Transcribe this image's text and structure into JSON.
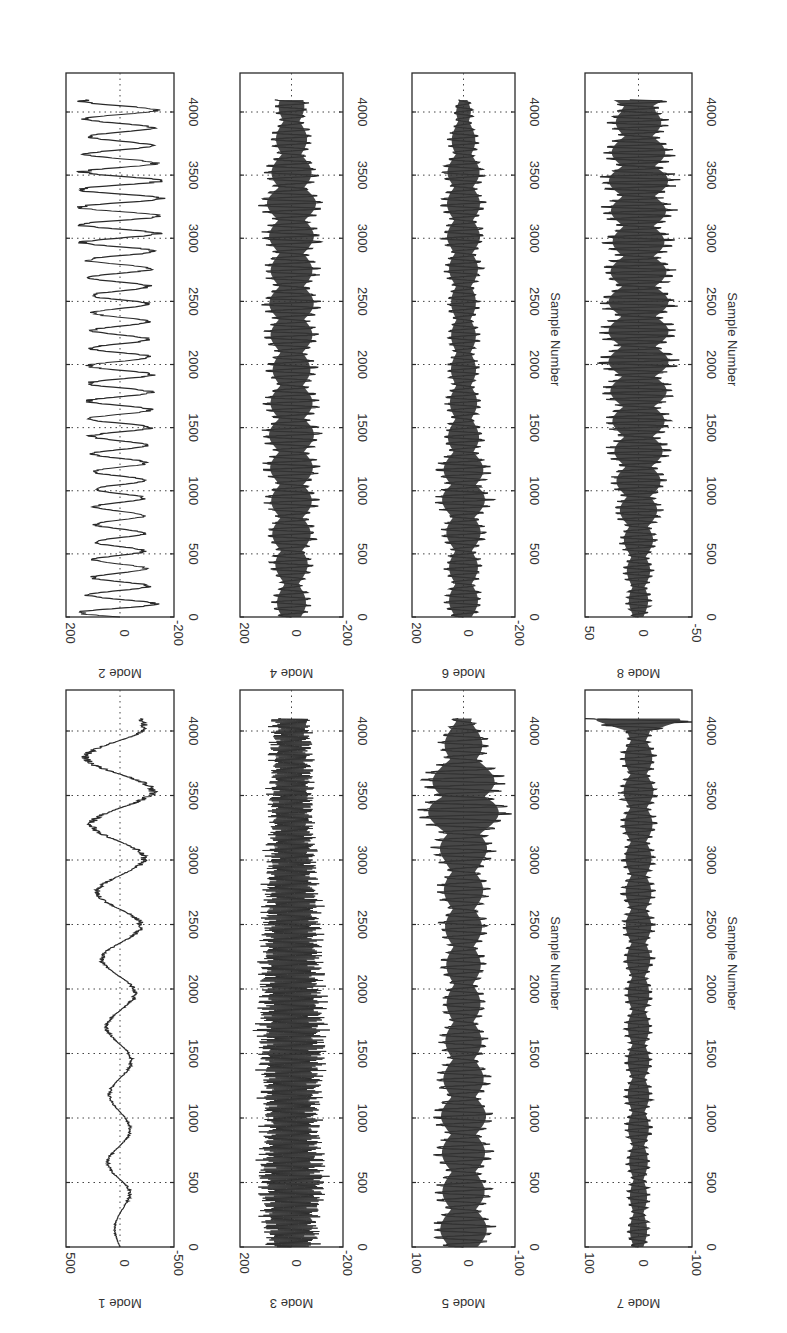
{
  "figure": {
    "orientation": "rotated-90-clockwise",
    "background": "#ffffff",
    "ink": "#2a2a2a"
  },
  "chart_data": {
    "type": "line",
    "title": "",
    "xlabel": "Sample Number",
    "x_ticks": [
      0,
      500,
      1000,
      1500,
      2000,
      2500,
      3000,
      3500,
      4000
    ],
    "xlim": [
      0,
      4300
    ],
    "grid": "dotted at x ticks and y=0",
    "legend": "none",
    "subplots": [
      {
        "name": "Mode 1",
        "ylabel": "Mode 1",
        "ylim": [
          -500,
          500
        ],
        "y_ticks": [
          -500,
          0,
          500
        ],
        "row": "lower",
        "col": 0,
        "style": "line",
        "envelope": [
          [
            0,
            40
          ],
          [
            300,
            60
          ],
          [
            500,
            120
          ],
          [
            1000,
            90
          ],
          [
            1500,
            110
          ],
          [
            2000,
            140
          ],
          [
            2500,
            200
          ],
          [
            3000,
            220
          ],
          [
            3500,
            300
          ],
          [
            3900,
            320
          ],
          [
            4096,
            200
          ]
        ],
        "freq": 0.012
      },
      {
        "name": "Mode 2",
        "ylabel": "Mode 2",
        "ylim": [
          -200,
          200
        ],
        "y_ticks": [
          -200,
          0,
          200
        ],
        "row": "upper",
        "col": 0,
        "style": "line",
        "envelope": [
          [
            0,
            150
          ],
          [
            200,
            110
          ],
          [
            500,
            90
          ],
          [
            1000,
            90
          ],
          [
            1500,
            110
          ],
          [
            1900,
            120
          ],
          [
            2300,
            100
          ],
          [
            2700,
            110
          ],
          [
            3000,
            140
          ],
          [
            3400,
            150
          ],
          [
            3800,
            110
          ],
          [
            4096,
            140
          ]
        ],
        "freq": 0.045
      },
      {
        "name": "Mode 3",
        "ylabel": "Mode 3",
        "ylim": [
          -200,
          200
        ],
        "y_ticks": [
          -200,
          0,
          200
        ],
        "row": "lower",
        "col": 1,
        "style": "dense",
        "envelope": [
          [
            0,
            100
          ],
          [
            500,
            140
          ],
          [
            1000,
            110
          ],
          [
            1500,
            140
          ],
          [
            2000,
            130
          ],
          [
            2500,
            120
          ],
          [
            3000,
            100
          ],
          [
            3500,
            90
          ],
          [
            4096,
            80
          ]
        ],
        "freq": 0.12
      },
      {
        "name": "Mode 4",
        "ylabel": "Mode 4",
        "ylim": [
          -200,
          200
        ],
        "y_ticks": [
          -200,
          0,
          200
        ],
        "row": "upper",
        "col": 1,
        "style": "filled",
        "envelope": [
          [
            0,
            80
          ],
          [
            250,
            60
          ],
          [
            500,
            90
          ],
          [
            1000,
            100
          ],
          [
            1500,
            110
          ],
          [
            2000,
            90
          ],
          [
            2400,
            110
          ],
          [
            2800,
            100
          ],
          [
            3300,
            120
          ],
          [
            3700,
            80
          ],
          [
            4096,
            60
          ]
        ],
        "freq": 0.02
      },
      {
        "name": "Mode 5",
        "ylabel": "Mode 5",
        "ylim": [
          -100,
          100
        ],
        "y_ticks": [
          -100,
          0,
          100
        ],
        "row": "lower",
        "col": 2,
        "style": "filled",
        "envelope": [
          [
            0,
            60
          ],
          [
            200,
            55
          ],
          [
            500,
            50
          ],
          [
            1000,
            55
          ],
          [
            1500,
            45
          ],
          [
            2000,
            40
          ],
          [
            2500,
            45
          ],
          [
            3000,
            50
          ],
          [
            3450,
            95
          ],
          [
            3800,
            55
          ],
          [
            4096,
            30
          ]
        ],
        "freq": 0.018
      },
      {
        "name": "Mode 6",
        "ylabel": "Mode 6",
        "ylim": [
          -200,
          200
        ],
        "y_ticks": [
          -200,
          0,
          200
        ],
        "row": "upper",
        "col": 2,
        "style": "filled",
        "envelope": [
          [
            0,
            70
          ],
          [
            500,
            70
          ],
          [
            1000,
            110
          ],
          [
            1500,
            70
          ],
          [
            2000,
            60
          ],
          [
            2500,
            60
          ],
          [
            3000,
            80
          ],
          [
            3500,
            80
          ],
          [
            4000,
            40
          ],
          [
            4096,
            20
          ]
        ],
        "freq": 0.02
      },
      {
        "name": "Mode 7",
        "ylabel": "Mode 7",
        "ylim": [
          -100,
          100
        ],
        "y_ticks": [
          -100,
          0,
          100
        ],
        "row": "lower",
        "col": 3,
        "style": "filled",
        "envelope": [
          [
            0,
            20
          ],
          [
            500,
            20
          ],
          [
            1000,
            25
          ],
          [
            1500,
            25
          ],
          [
            2000,
            25
          ],
          [
            2500,
            30
          ],
          [
            3000,
            30
          ],
          [
            3500,
            35
          ],
          [
            4000,
            30
          ],
          [
            4080,
            100
          ],
          [
            4096,
            100
          ]
        ],
        "freq": 0.02
      },
      {
        "name": "Mode 8",
        "ylabel": "Mode 8",
        "ylim": [
          -50,
          50
        ],
        "y_ticks": [
          -50,
          0,
          50
        ],
        "row": "upper",
        "col": 3,
        "style": "filled",
        "envelope": [
          [
            0,
            10
          ],
          [
            500,
            15
          ],
          [
            1000,
            25
          ],
          [
            1500,
            30
          ],
          [
            2000,
            35
          ],
          [
            2500,
            35
          ],
          [
            3000,
            30
          ],
          [
            3500,
            35
          ],
          [
            4000,
            25
          ],
          [
            4096,
            35
          ]
        ],
        "freq": 0.022
      }
    ]
  },
  "layout": {
    "columns": [
      [
        66,
        174
      ],
      [
        240,
        343
      ],
      [
        412,
        515
      ],
      [
        585,
        692
      ]
    ],
    "rows": {
      "upper": {
        "top": 73,
        "bottom": 617,
        "px_per_sample": 0.12625
      },
      "lower": {
        "top": 690,
        "bottom": 1247,
        "px_per_sample": 0.129
      }
    }
  }
}
